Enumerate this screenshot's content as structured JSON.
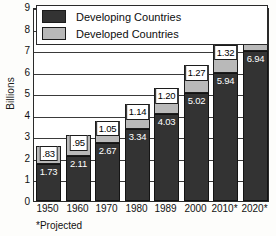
{
  "chart_data": {
    "type": "bar",
    "stacked": true,
    "title": "",
    "xlabel": "",
    "ylabel": "Billions",
    "ylim": [
      0,
      9
    ],
    "yticks": [
      "0",
      "1",
      "2",
      "3",
      "4",
      "5",
      "6",
      "7",
      "8",
      "9"
    ],
    "grid": true,
    "legend_position": "top-inside",
    "categories": [
      "1950",
      "1960",
      "1970",
      "1980",
      "1989",
      "2000",
      "2010*",
      "2020*"
    ],
    "series": [
      {
        "name": "Developing Countries",
        "color": "#333333",
        "values": [
          1.73,
          2.11,
          2.67,
          3.34,
          4.03,
          5.02,
          5.94,
          6.94
        ],
        "labels": [
          "1.73",
          "2.11",
          "2.67",
          "3.34",
          "4.03",
          "5.02",
          "5.94",
          "6.94"
        ]
      },
      {
        "name": "Developed Countries",
        "color": "#b9b9b9",
        "values": [
          0.83,
          0.95,
          1.05,
          1.14,
          1.2,
          1.27,
          1.32,
          1.35
        ],
        "labels": [
          ".83",
          ".95",
          "1.05",
          "1.14",
          "1.20",
          "1.27",
          "1.32",
          "1.35"
        ]
      }
    ],
    "totals": [
      2.56,
      3.06,
      3.72,
      4.48,
      5.23,
      6.29,
      7.26,
      8.29
    ],
    "annotations": [
      "*Projected"
    ]
  },
  "legend": {
    "items": [
      {
        "label": "Developing Countries",
        "swatch": "dark-swatch"
      },
      {
        "label": "Developed Countries",
        "swatch": "light-swatch"
      }
    ]
  },
  "footnote": "*Projected",
  "axis": {
    "y_title": "Billions"
  }
}
